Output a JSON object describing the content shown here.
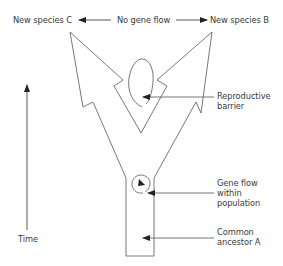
{
  "labels": {
    "species_c": "New species C",
    "no_gene_flow": "No gene flow",
    "species_b": "New species B",
    "reproductive_barrier_line1": "Reproductive",
    "reproductive_barrier_line2": "barrier",
    "gene_flow_line1": "Gene flow",
    "gene_flow_line2": "within",
    "gene_flow_line3": "population",
    "time": "Time",
    "ancestor_line1": "Common",
    "ancestor_line2": "ancestor A"
  },
  "colors": {
    "stroke": "#555555",
    "arrow": "#222222",
    "text": "#3a3a3a"
  }
}
